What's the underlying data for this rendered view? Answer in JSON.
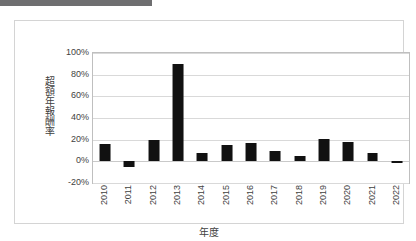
{
  "redaction": {
    "name": "redacted-header-bar",
    "color": "#6e6e70"
  },
  "chart_data": {
    "type": "bar",
    "title": "",
    "subtitle": "",
    "xlabel": "年度",
    "ylabel": "超額年報酬率",
    "categories": [
      "2010",
      "2011",
      "2012",
      "2013",
      "2014",
      "2015",
      "2016",
      "2017",
      "2018",
      "2019",
      "2020",
      "2021",
      "2022"
    ],
    "values": [
      16,
      -5,
      20,
      90,
      8,
      15,
      17,
      10,
      5,
      21,
      18,
      8,
      -1
    ],
    "value_unit": "%",
    "ylim": [
      -20,
      100
    ],
    "yticks": [
      100,
      80,
      60,
      40,
      20,
      0,
      -20
    ],
    "ytick_labels": [
      "100%",
      "80%",
      "60%",
      "40%",
      "20%",
      "0%",
      "-20%"
    ],
    "grid": true,
    "legend": "none",
    "series_color": "#111111",
    "gridline_color": "#d9d9d9",
    "plot_border_color": "#bfbfbf"
  }
}
